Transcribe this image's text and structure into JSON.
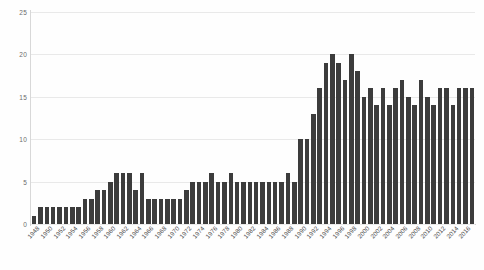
{
  "chart_data": {
    "type": "bar",
    "title": "",
    "subtitle": "",
    "xlabel": "",
    "ylabel": "",
    "ylim": [
      0,
      25
    ],
    "yticks": [
      0,
      5,
      10,
      15,
      20,
      25
    ],
    "grid": true,
    "legend": "none",
    "bar_color": "#3c3c3c",
    "background_color": "#fefefe",
    "gridline_color": "#e9e9e9",
    "axis_color": "#d8d8d8",
    "xtick_step": 2,
    "xtick_rotation": -48,
    "categories": [
      "1948",
      "1949",
      "1950",
      "1951",
      "1952",
      "1953",
      "1954",
      "1955",
      "1956",
      "1957",
      "1958",
      "1959",
      "1960",
      "1961",
      "1962",
      "1963",
      "1964",
      "1965",
      "1966",
      "1967",
      "1968",
      "1969",
      "1970",
      "1971",
      "1972",
      "1973",
      "1974",
      "1975",
      "1976",
      "1977",
      "1978",
      "1979",
      "1980",
      "1981",
      "1982",
      "1983",
      "1984",
      "1985",
      "1986",
      "1987",
      "1988",
      "1989",
      "1990",
      "1991",
      "1992",
      "1993",
      "1994",
      "1995",
      "1996",
      "1997",
      "1998",
      "1999",
      "2000",
      "2001",
      "2002",
      "2003",
      "2004",
      "2005",
      "2006",
      "2007",
      "2008",
      "2009",
      "2010",
      "2011",
      "2012",
      "2013",
      "2014",
      "2015",
      "2016",
      "2017"
    ],
    "xtick_labels": [
      "1948",
      "1950",
      "1952",
      "1954",
      "1956",
      "1958",
      "1960",
      "1962",
      "1964",
      "1966",
      "1968",
      "1970",
      "1972",
      "1974",
      "1976",
      "1978",
      "1980",
      "1982",
      "1984",
      "1986",
      "1988",
      "1990",
      "1992",
      "1994",
      "1996",
      "1998",
      "2000",
      "2002",
      "2004",
      "2006",
      "2008",
      "2010",
      "2012",
      "2014",
      "2016"
    ],
    "values": [
      1,
      2,
      2,
      2,
      2,
      2,
      2,
      2,
      3,
      3,
      4,
      4,
      5,
      6,
      6,
      6,
      4,
      6,
      3,
      3,
      3,
      3,
      3,
      3,
      4,
      5,
      5,
      5,
      6,
      5,
      5,
      6,
      5,
      5,
      5,
      5,
      5,
      5,
      5,
      5,
      6,
      5,
      10,
      10,
      13,
      16,
      19,
      20,
      19,
      17,
      20,
      18,
      15,
      16,
      14,
      16,
      14,
      16,
      17,
      15,
      14,
      17,
      15,
      14,
      16,
      16,
      14,
      16,
      16,
      16
    ]
  }
}
